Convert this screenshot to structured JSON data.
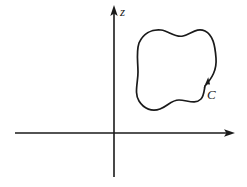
{
  "figure": {
    "background_color": "#ffffff",
    "ink_color": "#1a1a1a",
    "width": 247,
    "height": 187
  },
  "axes": {
    "vertical": {
      "label": "z",
      "label_style": "italic",
      "x": 114,
      "top_y": 8,
      "bottom_y": 177,
      "arrow_at": "top"
    },
    "horizontal": {
      "label": "",
      "y": 133,
      "left_x": 15,
      "right_x": 233,
      "arrow_at": "right"
    },
    "origin": {
      "x": 114,
      "y": 133
    }
  },
  "contour": {
    "label": "C",
    "label_style": "italic",
    "label_position": {
      "x": 210,
      "y": 96
    },
    "closed": true,
    "orientation": "counterclockwise",
    "quadrant": "upper-right",
    "bounds": {
      "left": 136,
      "top": 30,
      "right": 216,
      "bottom": 112
    },
    "direction_arrow": {
      "x": 207,
      "y": 82,
      "points": "up-right"
    },
    "path": "M 205 86 C 212 78 216 70 216 58 C 216 46 214 36 206 32 C 198 28 192 34 184 36 C 176 38 170 32 162 30 C 152 28 144 33 140 42 C 136 52 138 62 138 72 C 138 82 134 92 138 100 C 142 108 150 112 158 110 C 166 108 170 100 178 100 C 186 100 194 104 200 100 C 203 98 204 92 205 86 Z"
  }
}
